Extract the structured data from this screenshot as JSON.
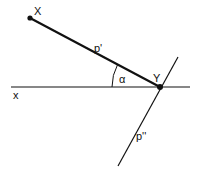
{
  "diagram": {
    "points": {
      "X": {
        "label": "X",
        "x": 30,
        "y": 18
      },
      "Y": {
        "label": "Y",
        "x": 160,
        "y": 87
      }
    },
    "lines": {
      "axis_label": "x",
      "segment_XY_label": "p'",
      "line_through_Y_label": "p''"
    },
    "angle": {
      "label": "α",
      "between": [
        "x-axis",
        "p'"
      ]
    },
    "colors": {
      "stroke": "#111111",
      "background": "#ffffff"
    }
  }
}
